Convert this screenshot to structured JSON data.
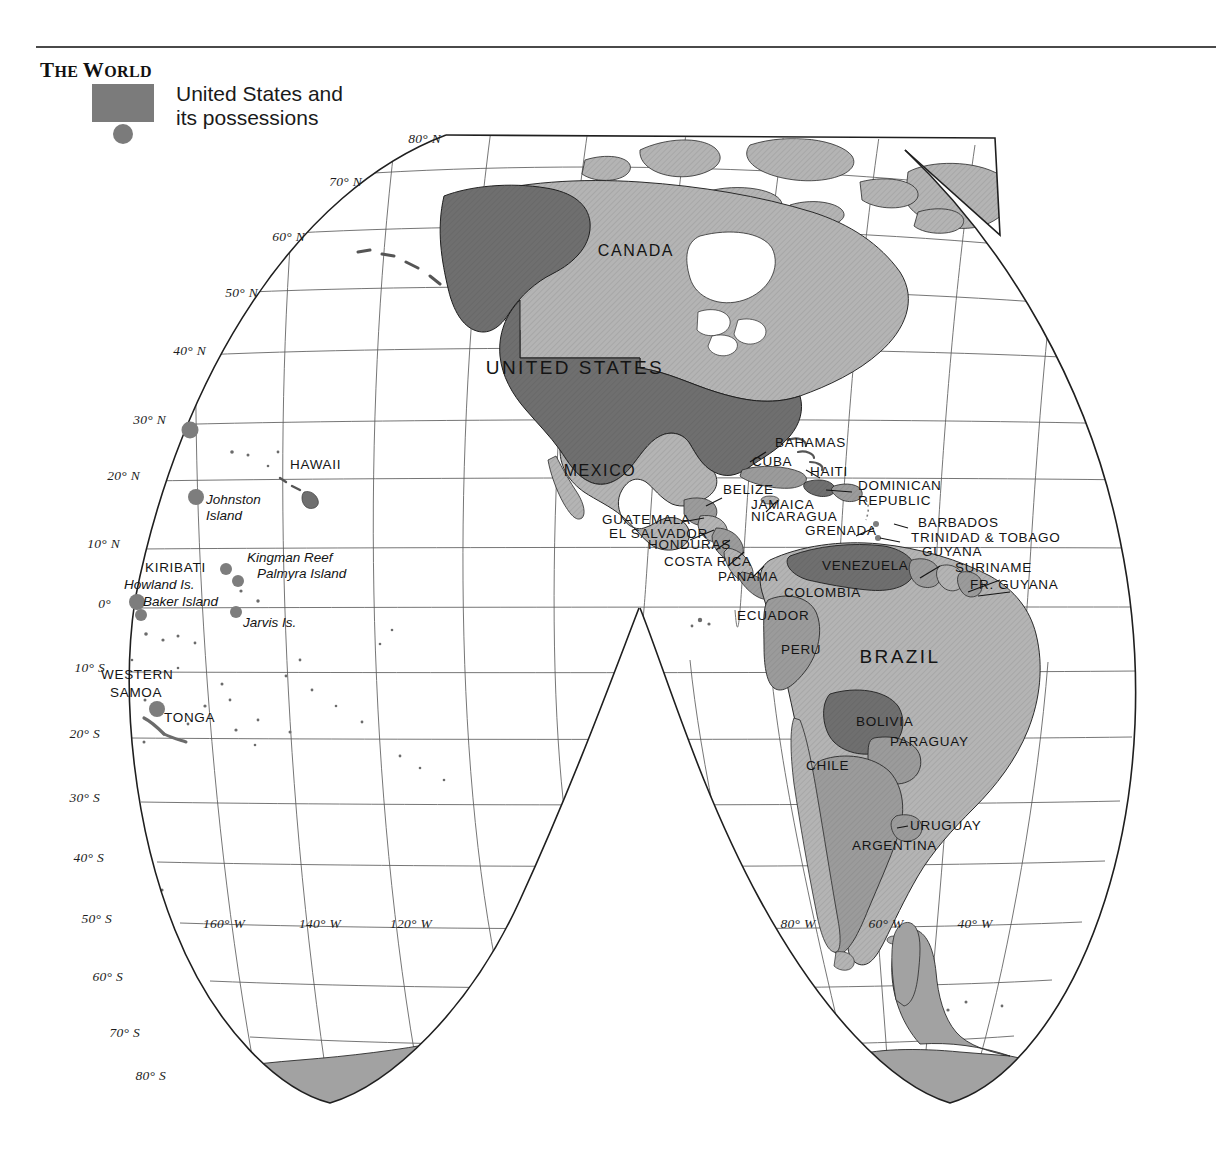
{
  "header": {
    "title_full": "THE WORLD",
    "title_cap": "T",
    "title_rest_1": "HE ",
    "title_cap2": "W",
    "title_rest_2": "ORLD"
  },
  "legend": {
    "label_line1": "United States and",
    "label_line2": "its possessions",
    "swatch_color": "#7b7b7b",
    "dot_color": "#7b7b7b",
    "swatch_name": "area-swatch",
    "dot_name": "point-swatch"
  },
  "colors": {
    "us_fill": "#6f6f6f",
    "land_fill": "#a9a9a9",
    "land_light": "#bdbdbd",
    "antarctica_fill": "#a2a2a2",
    "graticule": "#5a5a5a",
    "outline": "#1f1f1f",
    "text": "#141414"
  },
  "graticule": {
    "latitudes": [
      {
        "label": "80° N",
        "x": 441,
        "y": 143
      },
      {
        "label": "70° N",
        "x": 362,
        "y": 186
      },
      {
        "label": "60° N",
        "x": 305,
        "y": 241
      },
      {
        "label": "50° N",
        "x": 258,
        "y": 297
      },
      {
        "label": "40° N",
        "x": 206,
        "y": 355
      },
      {
        "label": "30° N",
        "x": 166,
        "y": 424
      },
      {
        "label": "20° N",
        "x": 140,
        "y": 480
      },
      {
        "label": "10° N",
        "x": 120,
        "y": 548
      },
      {
        "label": "0°",
        "x": 111,
        "y": 608
      },
      {
        "label": "10° S",
        "x": 105,
        "y": 672
      },
      {
        "label": "20° S",
        "x": 100,
        "y": 738
      },
      {
        "label": "30° S",
        "x": 100,
        "y": 802
      },
      {
        "label": "40° S",
        "x": 104,
        "y": 862
      },
      {
        "label": "50° S",
        "x": 112,
        "y": 923
      },
      {
        "label": "60° S",
        "x": 123,
        "y": 981
      },
      {
        "label": "70° S",
        "x": 140,
        "y": 1037
      },
      {
        "label": "80° S",
        "x": 166,
        "y": 1080
      }
    ],
    "longitudes": [
      {
        "label": "160° W",
        "x": 224,
        "y": 928
      },
      {
        "label": "140° W",
        "x": 320,
        "y": 928
      },
      {
        "label": "120° W",
        "x": 411,
        "y": 928
      },
      {
        "label": "80° W",
        "x": 798,
        "y": 928
      },
      {
        "label": "60° W",
        "x": 886,
        "y": 928
      },
      {
        "label": "40° W",
        "x": 975,
        "y": 928
      }
    ]
  },
  "map_labels": {
    "major": [
      {
        "name": "canada",
        "text": "CANADA",
        "x": 636,
        "y": 256,
        "cls": "lbl lbl-mid"
      },
      {
        "name": "united-states",
        "text": "UNITED STATES",
        "x": 575,
        "y": 374,
        "cls": "lbl lbl-big"
      },
      {
        "name": "mexico",
        "text": "MEXICO",
        "x": 600,
        "y": 476,
        "cls": "lbl lbl-mid"
      },
      {
        "name": "brazil",
        "text": "BRAZIL",
        "x": 900,
        "y": 663,
        "cls": "lbl lbl-big"
      }
    ],
    "countries": [
      {
        "name": "hawaii",
        "text": "HAWAII",
        "x": 290,
        "y": 469
      },
      {
        "name": "kiribati",
        "text": "KIRIBATI",
        "x": 145,
        "y": 572
      },
      {
        "name": "western-samoa-1",
        "text": "WESTERN",
        "x": 101,
        "y": 679
      },
      {
        "name": "western-samoa-2",
        "text": "SAMOA",
        "x": 110,
        "y": 697
      },
      {
        "name": "tonga",
        "text": "TONGA",
        "x": 164,
        "y": 722
      },
      {
        "name": "bahamas",
        "text": "BAHAMAS",
        "x": 775,
        "y": 447
      },
      {
        "name": "cuba",
        "text": "CUBA",
        "x": 752,
        "y": 466
      },
      {
        "name": "haiti",
        "text": "HAITI",
        "x": 810,
        "y": 476
      },
      {
        "name": "dominican-republic-1",
        "text": "DOMINICAN",
        "x": 858,
        "y": 490
      },
      {
        "name": "dominican-republic-2",
        "text": "REPUBLIC",
        "x": 858,
        "y": 505
      },
      {
        "name": "belize",
        "text": "BELIZE",
        "x": 723,
        "y": 494
      },
      {
        "name": "jamaica",
        "text": "JAMAICA",
        "x": 751,
        "y": 509
      },
      {
        "name": "guatemala",
        "text": "GUATEMALA",
        "x": 602,
        "y": 524
      },
      {
        "name": "nicaragua",
        "text": "NICARAGUA",
        "x": 751,
        "y": 521
      },
      {
        "name": "el-salvador",
        "text": "EL SALVADOR",
        "x": 609,
        "y": 538
      },
      {
        "name": "honduras",
        "text": "HONDURAS",
        "x": 648,
        "y": 549
      },
      {
        "name": "costa-rica",
        "text": "COSTA RICA",
        "x": 664,
        "y": 566
      },
      {
        "name": "panama",
        "text": "PANAMA",
        "x": 718,
        "y": 581
      },
      {
        "name": "grenada",
        "text": "GRENADA",
        "x": 805,
        "y": 535
      },
      {
        "name": "barbados",
        "text": "BARBADOS",
        "x": 918,
        "y": 527
      },
      {
        "name": "trinidad-tobago",
        "text": "TRINIDAD & TOBAGO",
        "x": 911,
        "y": 542
      },
      {
        "name": "venezuela",
        "text": "VENEZUELA",
        "x": 822,
        "y": 570
      },
      {
        "name": "guyana",
        "text": "GUYANA",
        "x": 922,
        "y": 556
      },
      {
        "name": "suriname",
        "text": "SURINAME",
        "x": 955,
        "y": 572
      },
      {
        "name": "fr-guyana",
        "text": "FR. GUYANA",
        "x": 970,
        "y": 589
      },
      {
        "name": "colombia",
        "text": "COLOMBIA",
        "x": 784,
        "y": 597
      },
      {
        "name": "ecuador",
        "text": "ECUADOR",
        "x": 737,
        "y": 620
      },
      {
        "name": "peru",
        "text": "PERU",
        "x": 781,
        "y": 654
      },
      {
        "name": "bolivia",
        "text": "BOLIVIA",
        "x": 856,
        "y": 726
      },
      {
        "name": "paraguay",
        "text": "PARAGUAY",
        "x": 890,
        "y": 746
      },
      {
        "name": "chile",
        "text": "CHILE",
        "x": 806,
        "y": 770
      },
      {
        "name": "uruguay",
        "text": "URUGUAY",
        "x": 910,
        "y": 830
      },
      {
        "name": "argentina",
        "text": "ARGENTINA",
        "x": 852,
        "y": 850
      }
    ],
    "possessions": [
      {
        "name": "johnston-island-1",
        "text": "Johnston",
        "x": 206,
        "y": 504
      },
      {
        "name": "johnston-island-2",
        "text": "Island",
        "x": 206,
        "y": 520
      },
      {
        "name": "kingman-reef",
        "text": "Kingman Reef",
        "x": 247,
        "y": 562
      },
      {
        "name": "palmyra-island",
        "text": "Palmyra Island",
        "x": 257,
        "y": 578
      },
      {
        "name": "howland-is",
        "text": "Howland Is.",
        "x": 124,
        "y": 589
      },
      {
        "name": "baker-island",
        "text": "Baker Island",
        "x": 143,
        "y": 606
      },
      {
        "name": "jarvis-is",
        "text": "Jarvis  Is.",
        "x": 243,
        "y": 627
      }
    ]
  },
  "possession_dots": [
    {
      "name": "midway-dot",
      "cx": 190,
      "cy": 430,
      "r": 8.5
    },
    {
      "name": "johnston-dot",
      "cx": 196,
      "cy": 497,
      "r": 8
    },
    {
      "name": "kingman-dot",
      "cx": 226,
      "cy": 569,
      "r": 6
    },
    {
      "name": "palmyra-dot",
      "cx": 238,
      "cy": 581,
      "r": 6
    },
    {
      "name": "baker-dot",
      "cx": 137,
      "cy": 602,
      "r": 8
    },
    {
      "name": "howland-dot",
      "cx": 141,
      "cy": 615,
      "r": 6
    },
    {
      "name": "jarvis-dot",
      "cx": 236,
      "cy": 612,
      "r": 6
    },
    {
      "name": "samoa-dot",
      "cx": 157,
      "cy": 709,
      "r": 8
    }
  ]
}
